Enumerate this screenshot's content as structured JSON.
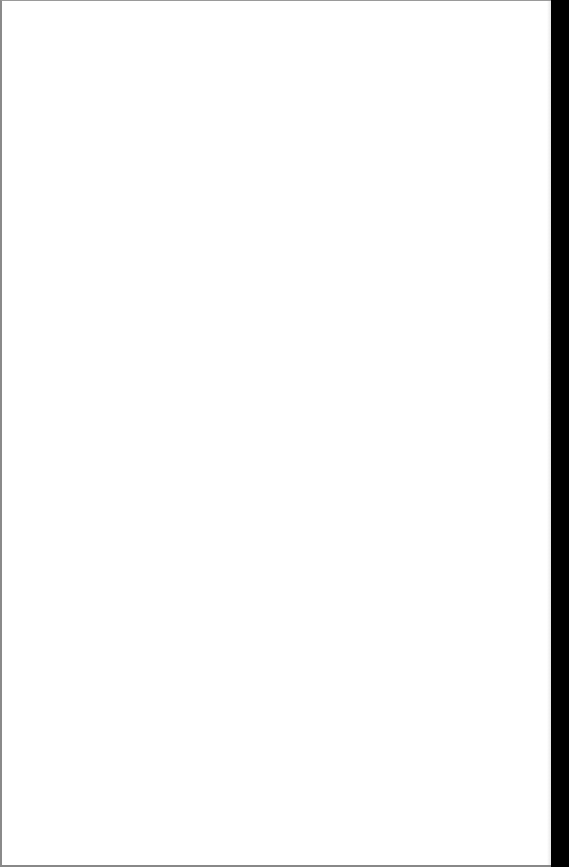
{
  "document": {
    "type": "blank-scanned-page",
    "text": "",
    "colors": {
      "paper": "#ffffff",
      "scan_border": "#000000",
      "edge": "#8a8a8a"
    }
  }
}
